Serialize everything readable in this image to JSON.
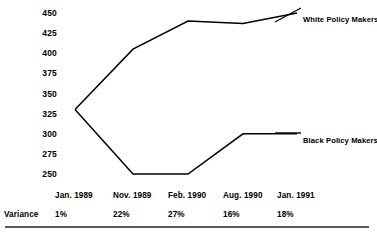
{
  "chart_data": {
    "type": "line",
    "title": "",
    "subtitle": "",
    "xlabel": "",
    "ylabel": "",
    "categories": [
      "Jan. 1989",
      "Nov. 1989",
      "Feb. 1990",
      "Aug. 1990",
      "Jan. 1991"
    ],
    "ylim": [
      250,
      450
    ],
    "yticks": [
      450,
      425,
      400,
      375,
      350,
      325,
      300,
      275,
      250
    ],
    "grid": false,
    "legend_position": "right-inline",
    "series": [
      {
        "name": "White Policy Makers",
        "color": "#000000",
        "values": [
          330,
          405,
          440,
          437,
          450
        ]
      },
      {
        "name": "Black Policy Makers",
        "color": "#000000",
        "values": [
          330,
          250,
          250,
          300,
          300
        ]
      }
    ],
    "annotations": {
      "variance_label": "Variance",
      "variance_values": [
        "1%",
        "22%",
        "27%",
        "16%",
        "18%"
      ]
    }
  },
  "axis": {
    "y_ticks": [
      "450",
      "425",
      "400",
      "375",
      "350",
      "325",
      "300",
      "275",
      "250"
    ]
  },
  "legend": {
    "white_label": "White Policy Makers",
    "black_label": "Black Policy Makers"
  },
  "categories": {
    "items": [
      "Jan. 1989",
      "Nov. 1989",
      "Feb. 1990",
      "Aug. 1990",
      "Jan. 1991"
    ]
  },
  "variance": {
    "title": "Variance",
    "items": [
      "1%",
      "22%",
      "27%",
      "16%",
      "18%"
    ]
  },
  "colors": {
    "line": "#000000",
    "text": "#000000",
    "rule": "#595959",
    "background": "#ffffff"
  }
}
